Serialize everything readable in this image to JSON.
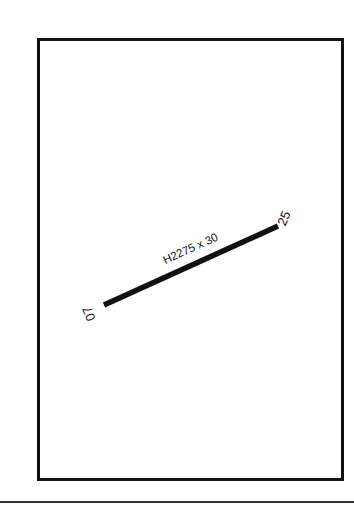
{
  "diagram": {
    "type": "airport-runway-diagram",
    "runway": {
      "designation_label": "H2275 x 30",
      "end_a": "07",
      "end_b": "25"
    },
    "colors": {
      "line": "#111111",
      "background": "#ffffff"
    }
  }
}
